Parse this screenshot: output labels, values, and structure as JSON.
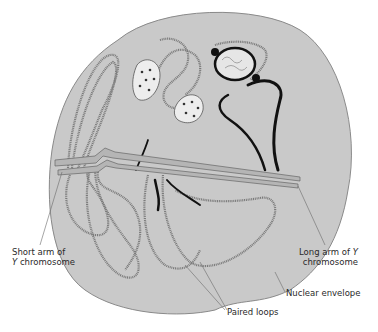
{
  "diagram": {
    "type": "nucleus-lampbrush-y-chromosome",
    "colors": {
      "background": "#ffffff",
      "nucleus_fill": "#c9c9c9",
      "nucleus_outline": "#8a8a8a",
      "loop_stroke": "#7a7a7a",
      "dark_loop": "#111111",
      "axis_fill": "#b5b5b5",
      "leader_line": "#6a6a6a",
      "text": "#2a2a2a"
    },
    "labels": {
      "short_arm_line1": "Short arm of",
      "short_arm_line2_italic": "Y",
      "short_arm_line2_rest": " chromosome",
      "long_arm_line1_rest": "Long arm of ",
      "long_arm_line1_italic": "Y",
      "long_arm_line2": "chromosome",
      "nuclear_envelope": "Nuclear envelope",
      "paired_loops": "Paired loops"
    },
    "structures": [
      "nuclear-envelope",
      "y-chromosome-axis",
      "paired-loops",
      "granular-bodies",
      "nucleolus-like-body"
    ]
  }
}
